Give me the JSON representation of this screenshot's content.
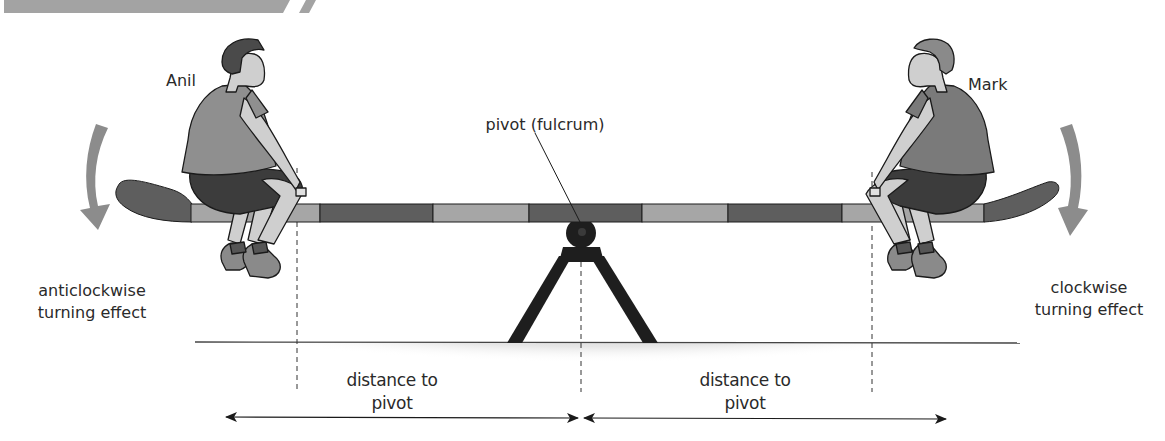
{
  "diagram": {
    "type": "seesaw-moments",
    "header_banner": {
      "color": "#a3a3a3"
    },
    "people": {
      "left": {
        "name": "Anil",
        "effect_label": "anticlockwise\nturning effect",
        "effect_line1": "anticlockwise",
        "effect_line2": "turning effect",
        "arrow_direction": "anticlockwise"
      },
      "right": {
        "name": "Mark",
        "effect_label": "clockwise\nturning effect",
        "effect_line1": "clockwise",
        "effect_line2": "turning effect",
        "arrow_direction": "clockwise"
      }
    },
    "pivot": {
      "label": "pivot (fulcrum)"
    },
    "distances": {
      "left": {
        "line1": "distance to",
        "line2": "pivot"
      },
      "right": {
        "line1": "distance to",
        "line2": "pivot"
      }
    },
    "colors": {
      "plank_dark": "#5e5e5e",
      "plank_light": "#a6a6a6",
      "stand": "#1e1e1e",
      "arrow": "#8c8c8c",
      "ground_shade": "#c4c4c4",
      "shirt_anil": "#8f8f8f",
      "shirt_mark": "#7a7a7a",
      "shorts": "#3c3c3c",
      "skin": "#cfcfcf",
      "hair": "#4a4a4a",
      "text": "#2a2a2a"
    }
  }
}
